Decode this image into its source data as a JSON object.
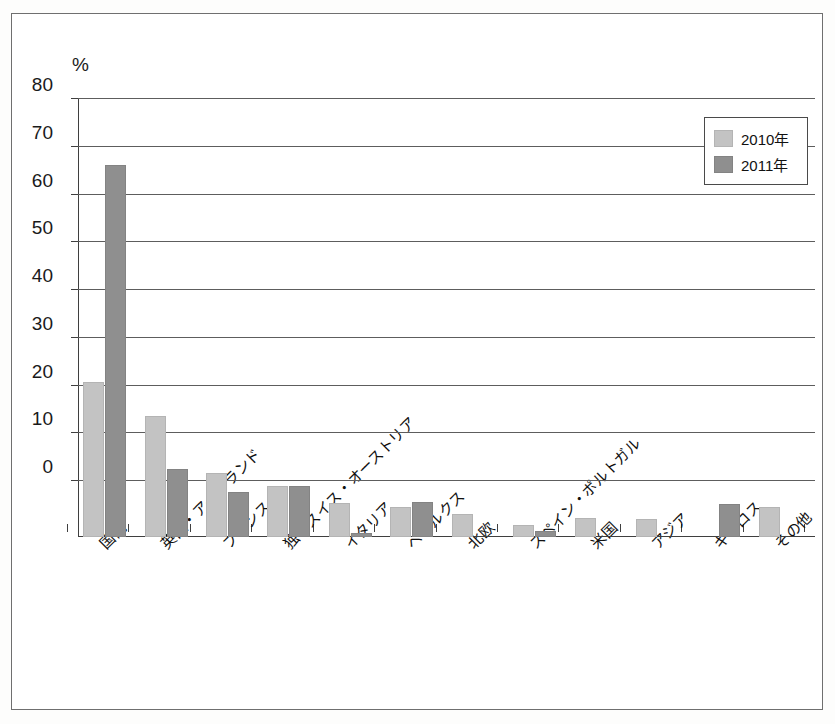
{
  "chart_data": {
    "type": "bar",
    "title": "",
    "xlabel": "",
    "ylabel": "%",
    "ylim": [
      0,
      80
    ],
    "ytick_step": 10,
    "yticks": [
      80,
      70,
      60,
      50,
      40,
      30,
      20,
      10,
      0
    ],
    "grid": "horizontal",
    "legend_position": "top-right",
    "note_axis": "Bars are drawn from the plot baseline, which lies below the 0 gridline; several categories fall below 0.",
    "categories": [
      "国内",
      "英国・アイルランド",
      "フランス",
      "独・スイス・オーストリア",
      "イタリア",
      "ベネルクス",
      "北欧",
      "スペイン・ポルトガル",
      "米国",
      "アジア",
      "キプロス",
      "その他"
    ],
    "series": [
      {
        "name": "2010年",
        "color": "#c3c3c3",
        "values": [
          20.5,
          13.5,
          1.5,
          -1.3,
          -4.8,
          -5.6,
          -7.1,
          -9.4,
          -8.0,
          -8.2,
          null,
          -5.6
        ]
      },
      {
        "name": "2011年",
        "color": "#8f8f8f",
        "values": [
          66.0,
          2.3,
          -2.5,
          -1.3,
          -11.0,
          -4.6,
          null,
          -10.7,
          null,
          null,
          -5.0,
          null
        ]
      }
    ]
  },
  "legend": {
    "items": [
      {
        "label": "2010年",
        "swatch": "light-gray-swatch"
      },
      {
        "label": "2011年",
        "swatch": "dark-gray-swatch"
      }
    ]
  },
  "axis": {
    "unit_label": "%",
    "y_tick_labels": [
      "80",
      "70",
      "60",
      "50",
      "40",
      "30",
      "20",
      "10",
      "0"
    ]
  },
  "colors": {
    "series_2010": "#c3c3c3",
    "series_2011": "#8f8f8f",
    "axis": "#3f3f3f",
    "grid": "#5d5d5d",
    "frame": "#6f6f6f",
    "text": "#111111",
    "background": "#ffffff"
  }
}
